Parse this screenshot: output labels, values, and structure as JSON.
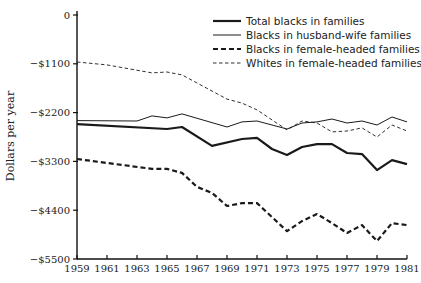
{
  "chart_data": {
    "type": "line",
    "title": "",
    "xlabel": "",
    "ylabel": "Dollars per year",
    "xlim": [
      1959,
      1981
    ],
    "ylim": [
      -5500,
      0
    ],
    "grid": false,
    "legend_position": "upper right (inside plot)",
    "x_ticks": [
      1959,
      1961,
      1963,
      1965,
      1967,
      1969,
      1971,
      1973,
      1975,
      1977,
      1979,
      1981
    ],
    "x_tick_labels": [
      "1959",
      "1961",
      "1963",
      "1965",
      "1967",
      "1969",
      "1971",
      "1973",
      "1975",
      "1977",
      "1979",
      "1981"
    ],
    "y_ticks": [
      0,
      -1100,
      -2200,
      -3300,
      -4400,
      -5500
    ],
    "y_tick_labels": [
      "0",
      "−$1100",
      "−$2200",
      "−$3300",
      "−$4400",
      "−$5500"
    ],
    "series": [
      {
        "name": "Total blacks in families",
        "style": "thick-solid",
        "x": [
          1959,
          1965,
          1966,
          1968,
          1970,
          1971,
          1972,
          1973,
          1974,
          1975,
          1976,
          1977,
          1978,
          1979,
          1980,
          1981
        ],
        "values": [
          -2460,
          -2570,
          -2525,
          -2950,
          -2795,
          -2770,
          -3020,
          -3155,
          -2975,
          -2910,
          -2910,
          -3110,
          -3135,
          -3495,
          -3270,
          -3360
        ]
      },
      {
        "name": "Blacks in husband-wife families",
        "style": "thin-solid",
        "x": [
          1959,
          1963,
          1964,
          1965,
          1966,
          1969,
          1970,
          1971,
          1973,
          1974,
          1975,
          1976,
          1977,
          1978,
          1979,
          1980,
          1981
        ],
        "values": [
          -2380,
          -2390,
          -2275,
          -2320,
          -2230,
          -2525,
          -2410,
          -2390,
          -2570,
          -2435,
          -2410,
          -2345,
          -2435,
          -2390,
          -2480,
          -2300,
          -2410
        ]
      },
      {
        "name": "Blacks in female-headed families",
        "style": "thick-dashed",
        "x": [
          1959,
          1964,
          1965,
          1966,
          1967,
          1968,
          1969,
          1970,
          1971,
          1973,
          1974,
          1975,
          1976,
          1977,
          1978,
          1979,
          1980,
          1981
        ],
        "values": [
          -3245,
          -3470,
          -3470,
          -3560,
          -3875,
          -4010,
          -4305,
          -4240,
          -4240,
          -4870,
          -4645,
          -4485,
          -4690,
          -4915,
          -4735,
          -5095,
          -4690,
          -4735
        ]
      },
      {
        "name": "Whites in female-headed families",
        "style": "thin-dashed",
        "x": [
          1959,
          1961,
          1964,
          1965,
          1966,
          1969,
          1970,
          1971,
          1973,
          1974,
          1975,
          1976,
          1977,
          1978,
          1979,
          1980,
          1981
        ],
        "values": [
          -1060,
          -1125,
          -1305,
          -1285,
          -1350,
          -1895,
          -1985,
          -2140,
          -2590,
          -2390,
          -2435,
          -2635,
          -2615,
          -2545,
          -2750,
          -2480,
          -2615
        ]
      }
    ]
  },
  "legend": {
    "items": [
      {
        "label": "Total blacks in families",
        "style": "thick-solid"
      },
      {
        "label": "Blacks in husband-wife families",
        "style": "thin-solid"
      },
      {
        "label": "Blacks in female-headed families",
        "style": "thick-dashed"
      },
      {
        "label": "Whites in female-headed families",
        "style": "thin-dashed"
      }
    ]
  },
  "colors": {
    "line": "#1a1a1a",
    "axis": "#111111",
    "text": "#222222",
    "background": "#ffffff"
  }
}
